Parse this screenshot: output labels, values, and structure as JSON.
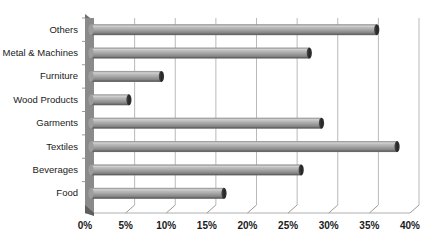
{
  "chart_data": {
    "type": "bar",
    "orientation": "horizontal",
    "title": "",
    "subtitle": "",
    "xlabel": "",
    "ylabel": "",
    "categories": [
      "Others",
      "Metal & Machines",
      "Furniture",
      "Wood Products",
      "Garments",
      "Textiles",
      "Beverages",
      "Food"
    ],
    "values": [
      34.8,
      26.5,
      8.3,
      4.3,
      28.0,
      37.3,
      25.5,
      16.0
    ],
    "value_unit": "%",
    "xlim": [
      0,
      40
    ],
    "xticks": [
      0,
      5,
      10,
      15,
      20,
      25,
      30,
      35,
      40
    ],
    "xtick_labels": [
      "0%",
      "5%",
      "10%",
      "15%",
      "20%",
      "25%",
      "30%",
      "35%",
      "40%"
    ],
    "grid": true,
    "grid_axis": "x",
    "legend": false,
    "legend_position": "none",
    "style": "3d-cylinder",
    "colors": {
      "bar_light": "#c2c2c2",
      "bar_mid": "#9b9b9b",
      "bar_dark": "#6e6e6e",
      "bar_cap": "#2e2e2e",
      "gridline": "#b9b9b9",
      "axis_wall": "#8a8a8a",
      "axis_wall_top": "#6f6f6f",
      "text": "#1a1a1a",
      "background": "#ffffff"
    }
  }
}
